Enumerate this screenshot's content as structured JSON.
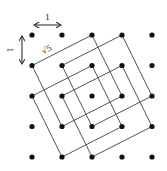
{
  "diagram": {
    "grid": {
      "cols": 5,
      "rows": 5,
      "origin_px": [
        32,
        35
      ],
      "spacing_px": [
        30,
        30.5
      ],
      "dot_color": "#111111",
      "dot_radius": 2.6
    },
    "squares": [
      {
        "id": "square-1",
        "vertices": [
          [
            0,
            1
          ],
          [
            2,
            0
          ],
          [
            3,
            2
          ],
          [
            1,
            3
          ]
        ]
      },
      {
        "id": "square-2",
        "vertices": [
          [
            1,
            1
          ],
          [
            3,
            0
          ],
          [
            4,
            2
          ],
          [
            2,
            3
          ]
        ]
      },
      {
        "id": "square-3",
        "vertices": [
          [
            0,
            2
          ],
          [
            2,
            1
          ],
          [
            3,
            3
          ],
          [
            1,
            4
          ]
        ]
      },
      {
        "id": "square-4",
        "vertices": [
          [
            1,
            2
          ],
          [
            3,
            1
          ],
          [
            4,
            3
          ],
          [
            2,
            4
          ]
        ]
      }
    ],
    "line_color": "#555555",
    "labels": {
      "horizontal_unit": "1",
      "vertical_unit": "1",
      "diagonal_side": "√5"
    }
  }
}
